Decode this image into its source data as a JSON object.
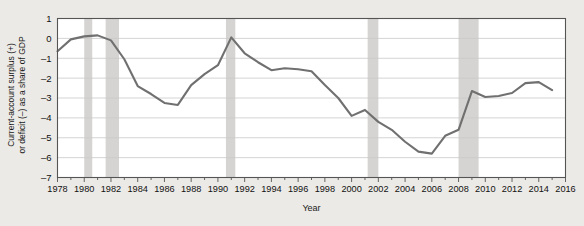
{
  "chart_data": {
    "type": "line",
    "title": "",
    "xlabel": "Year",
    "ylabel_line1": "Current-account surplus (+)",
    "ylabel_line2": "or deficit (–) as a share of GDP",
    "xlim": [
      1978,
      2016
    ],
    "ylim": [
      -7,
      1
    ],
    "ytick_values": [
      1,
      0,
      -1,
      -2,
      -3,
      -4,
      -5,
      -6,
      -7
    ],
    "ytick_labels": [
      "1",
      "0",
      "–1",
      "–2",
      "–3",
      "–4",
      "–5",
      "–6",
      "–7"
    ],
    "xtick_values": [
      1978,
      1980,
      1982,
      1984,
      1986,
      1988,
      1990,
      1992,
      1994,
      1996,
      1998,
      2000,
      2002,
      2004,
      2006,
      2008,
      2010,
      2012,
      2014,
      2016
    ],
    "xtick_labels": [
      "1978",
      "1980",
      "1982",
      "1984",
      "1986",
      "1988",
      "1990",
      "1992",
      "1994",
      "1996",
      "1998",
      "2000",
      "2002",
      "2004",
      "2006",
      "2008",
      "2010",
      "2012",
      "2014",
      "2016"
    ],
    "minor_xtick_interval": 1,
    "grid": "horizontal",
    "legend": "none",
    "series": [
      {
        "name": "Current-account balance as a share of GDP",
        "color": "#707070",
        "x": [
          1978,
          1979,
          1980,
          1981,
          1982,
          1983,
          1984,
          1985,
          1986,
          1987,
          1988,
          1989,
          1990,
          1991,
          1992,
          1993,
          1994,
          1995,
          1996,
          1997,
          1998,
          1999,
          2000,
          2001,
          2002,
          2003,
          2004,
          2005,
          2006,
          2007,
          2008,
          2009,
          2010,
          2011,
          2012,
          2013,
          2014,
          2015
        ],
        "values": [
          -0.65,
          -0.05,
          0.1,
          0.15,
          -0.1,
          -1.05,
          -2.4,
          -2.8,
          -3.25,
          -3.35,
          -2.35,
          -1.8,
          -1.35,
          0.05,
          -0.75,
          -1.2,
          -1.6,
          -1.5,
          -1.55,
          -1.65,
          -2.35,
          -3.0,
          -3.9,
          -3.6,
          -4.2,
          -4.6,
          -5.2,
          -5.7,
          -5.8,
          -4.9,
          -4.6,
          -2.65,
          -2.95,
          -2.9,
          -2.75,
          -2.25,
          -2.2,
          -2.6
        ]
      }
    ],
    "shaded_bands": [
      {
        "name": "recession-1980",
        "start": 1980.0,
        "end": 1980.6
      },
      {
        "name": "recession-1981-1982",
        "start": 1981.6,
        "end": 1982.6
      },
      {
        "name": "recession-1990-1991",
        "start": 1990.6,
        "end": 1991.3
      },
      {
        "name": "recession-2001",
        "start": 2001.2,
        "end": 2002.0
      },
      {
        "name": "recession-2008-2009",
        "start": 2008.0,
        "end": 2009.5
      }
    ],
    "band_color": "#d6d4d2",
    "axis_color": "#555555",
    "grid_color": "#c9c9c9",
    "background": "#ffffff",
    "page_background": "#eceae6"
  }
}
